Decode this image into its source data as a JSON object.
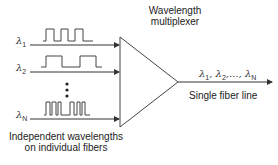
{
  "title": "Wavelength multiplexer",
  "mux_label_line1": "Wavelength",
  "mux_label_line2": "multiplexer",
  "inputs": [
    {
      "symbol": "λ",
      "sub": "1"
    },
    {
      "symbol": "λ",
      "sub": "2"
    },
    {
      "symbol": "λ",
      "sub": "N"
    }
  ],
  "ellipsis": "⋮",
  "input_caption_line1": "Independent wavelengths",
  "input_caption_line2": "on individual fibers",
  "output": {
    "label": "Single fiber line",
    "symbols": [
      {
        "symbol": "λ",
        "sub": "1",
        "sep": ", "
      },
      {
        "symbol": "λ",
        "sub": "2",
        "sep": ",..., "
      },
      {
        "symbol": "λ",
        "sub": "N",
        "sep": ""
      }
    ]
  },
  "colors": {
    "line": "#333333",
    "background": "#ffffff"
  }
}
